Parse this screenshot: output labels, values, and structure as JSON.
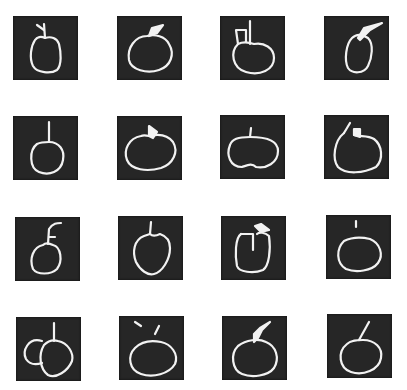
{
  "figure": {
    "type": "image-grid",
    "rows": 4,
    "cols": 4,
    "tile_background": "#262626",
    "stroke_color": "#f2f2f2",
    "page_background": "#ffffff",
    "tiles": [
      {
        "row": 0,
        "col": 0,
        "label": "apple-sketch-1",
        "x": 13,
        "y": 16
      },
      {
        "row": 0,
        "col": 1,
        "label": "apple-sketch-2",
        "x": 117,
        "y": 16
      },
      {
        "row": 0,
        "col": 2,
        "label": "apple-sketch-3",
        "x": 220,
        "y": 16
      },
      {
        "row": 0,
        "col": 3,
        "label": "apple-sketch-4",
        "x": 324,
        "y": 16
      },
      {
        "row": 1,
        "col": 0,
        "label": "apple-sketch-5",
        "x": 13,
        "y": 116
      },
      {
        "row": 1,
        "col": 1,
        "label": "apple-sketch-6",
        "x": 117,
        "y": 116
      },
      {
        "row": 1,
        "col": 2,
        "label": "apple-sketch-7",
        "x": 220,
        "y": 115
      },
      {
        "row": 1,
        "col": 3,
        "label": "apple-sketch-8",
        "x": 324,
        "y": 115
      },
      {
        "row": 2,
        "col": 0,
        "label": "apple-sketch-9",
        "x": 15,
        "y": 217
      },
      {
        "row": 2,
        "col": 1,
        "label": "apple-sketch-10",
        "x": 118,
        "y": 216
      },
      {
        "row": 2,
        "col": 2,
        "label": "apple-sketch-11",
        "x": 221,
        "y": 216
      },
      {
        "row": 2,
        "col": 3,
        "label": "apple-sketch-12",
        "x": 326,
        "y": 215
      },
      {
        "row": 3,
        "col": 0,
        "label": "apple-sketch-13",
        "x": 16,
        "y": 317
      },
      {
        "row": 3,
        "col": 1,
        "label": "apple-sketch-14",
        "x": 119,
        "y": 316
      },
      {
        "row": 3,
        "col": 2,
        "label": "apple-sketch-15",
        "x": 222,
        "y": 316
      },
      {
        "row": 3,
        "col": 3,
        "label": "apple-sketch-16",
        "x": 327,
        "y": 314
      }
    ]
  }
}
